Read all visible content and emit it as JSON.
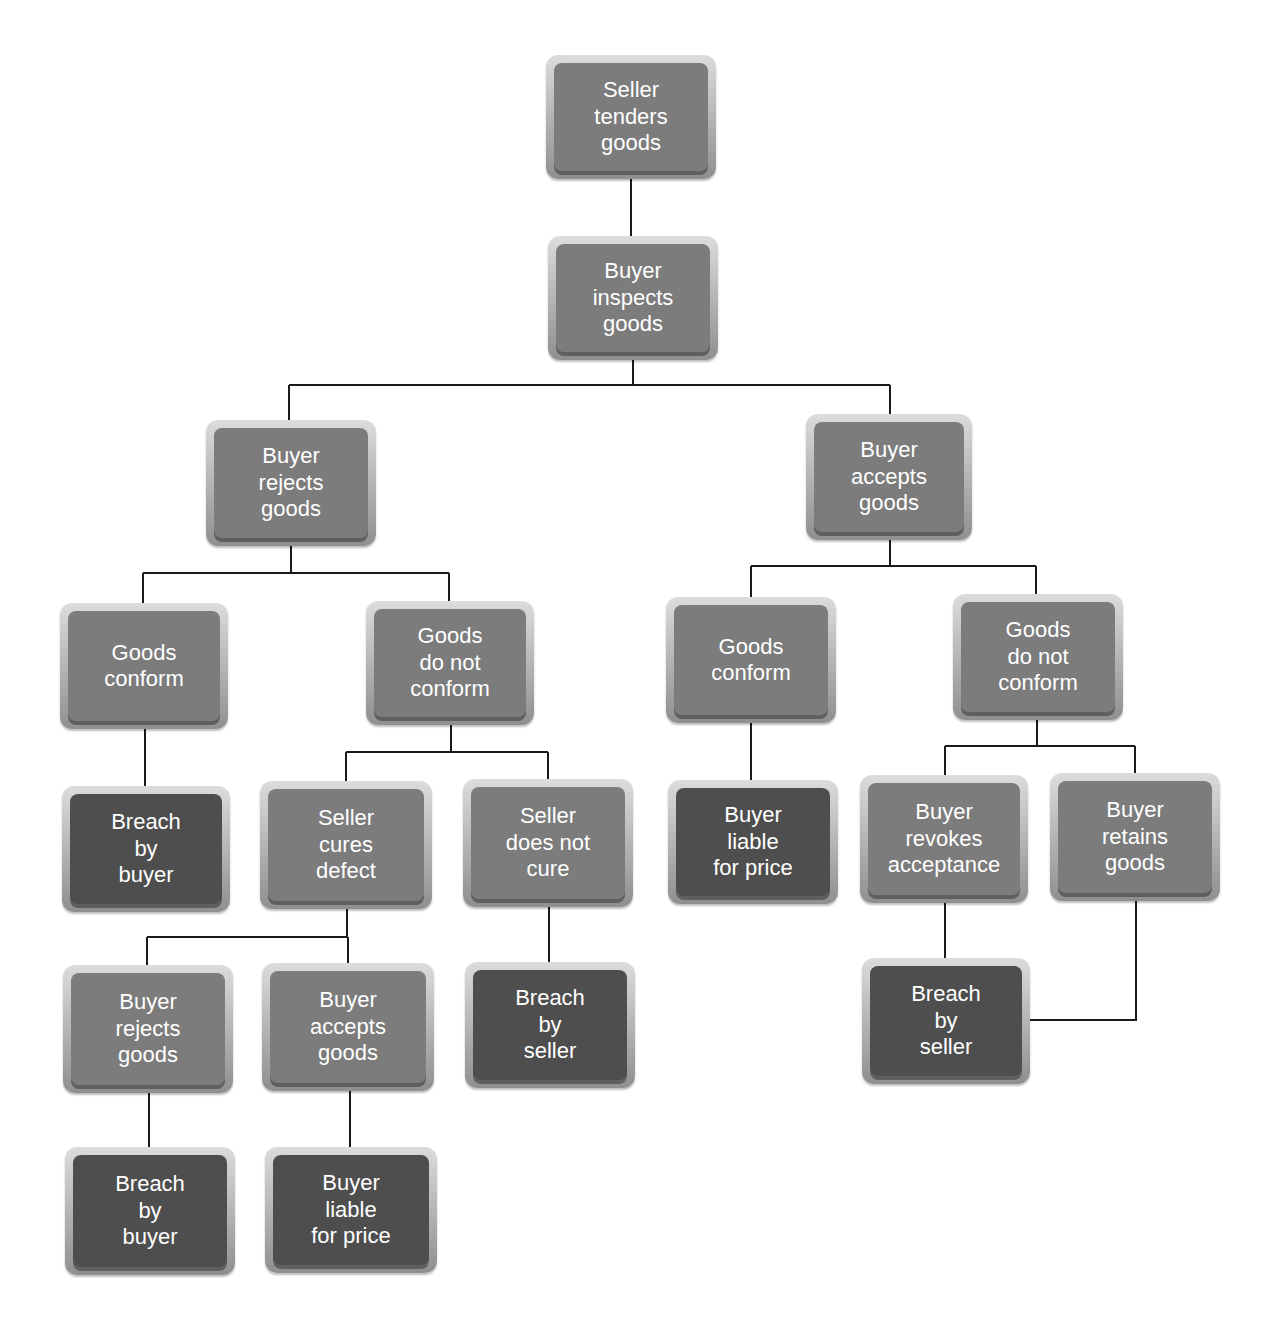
{
  "colors": {
    "line": "#1a1a1a",
    "node_mid": "#7c7c7c",
    "node_dark": "#4e4e4e",
    "text": "#ffffff"
  },
  "nodes": [
    {
      "id": "seller-tenders",
      "tone": "mid",
      "x": 546,
      "y": 55,
      "w": 170,
      "h": 124,
      "lines": [
        "Seller",
        "tenders",
        "goods"
      ]
    },
    {
      "id": "buyer-inspects",
      "tone": "mid",
      "x": 548,
      "y": 236,
      "w": 170,
      "h": 124,
      "lines": [
        "Buyer",
        "inspects",
        "goods"
      ]
    },
    {
      "id": "buyer-rejects",
      "tone": "mid",
      "x": 206,
      "y": 420,
      "w": 170,
      "h": 126,
      "lines": [
        "Buyer",
        "rejects",
        "goods"
      ]
    },
    {
      "id": "buyer-accepts",
      "tone": "mid",
      "x": 806,
      "y": 414,
      "w": 166,
      "h": 126,
      "lines": [
        "Buyer",
        "accepts",
        "goods"
      ]
    },
    {
      "id": "rej-goods-conform",
      "tone": "mid",
      "x": 60,
      "y": 603,
      "w": 168,
      "h": 126,
      "lines": [
        "Goods",
        "conform"
      ]
    },
    {
      "id": "rej-goods-not-conform",
      "tone": "mid",
      "x": 366,
      "y": 601,
      "w": 168,
      "h": 124,
      "lines": [
        "Goods",
        "do not",
        "conform"
      ]
    },
    {
      "id": "acc-goods-conform",
      "tone": "mid",
      "x": 666,
      "y": 597,
      "w": 170,
      "h": 126,
      "lines": [
        "Goods",
        "conform"
      ]
    },
    {
      "id": "acc-goods-not-conform",
      "tone": "mid",
      "x": 953,
      "y": 594,
      "w": 170,
      "h": 126,
      "lines": [
        "Goods",
        "do not",
        "conform"
      ]
    },
    {
      "id": "breach-by-buyer-1",
      "tone": "dark",
      "x": 62,
      "y": 786,
      "w": 168,
      "h": 126,
      "lines": [
        "Breach",
        "by",
        "buyer"
      ]
    },
    {
      "id": "seller-cures",
      "tone": "mid",
      "x": 260,
      "y": 781,
      "w": 172,
      "h": 128,
      "lines": [
        "Seller",
        "cures",
        "defect"
      ]
    },
    {
      "id": "seller-not-cure",
      "tone": "mid",
      "x": 463,
      "y": 779,
      "w": 170,
      "h": 128,
      "lines": [
        "Seller",
        "does not",
        "cure"
      ]
    },
    {
      "id": "buyer-liable-1",
      "tone": "dark",
      "x": 668,
      "y": 780,
      "w": 170,
      "h": 124,
      "lines": [
        "Buyer",
        "liable",
        "for price"
      ]
    },
    {
      "id": "buyer-revokes",
      "tone": "mid",
      "x": 860,
      "y": 775,
      "w": 168,
      "h": 128,
      "lines": [
        "Buyer",
        "revokes",
        "acceptance"
      ]
    },
    {
      "id": "buyer-retains",
      "tone": "mid",
      "x": 1050,
      "y": 773,
      "w": 170,
      "h": 128,
      "lines": [
        "Buyer",
        "retains",
        "goods"
      ]
    },
    {
      "id": "cured-buyer-rejects",
      "tone": "mid",
      "x": 63,
      "y": 965,
      "w": 170,
      "h": 128,
      "lines": [
        "Buyer",
        "rejects",
        "goods"
      ]
    },
    {
      "id": "cured-buyer-accepts",
      "tone": "mid",
      "x": 262,
      "y": 963,
      "w": 172,
      "h": 128,
      "lines": [
        "Buyer",
        "accepts",
        "goods"
      ]
    },
    {
      "id": "breach-by-seller-1",
      "tone": "dark",
      "x": 465,
      "y": 962,
      "w": 170,
      "h": 126,
      "lines": [
        "Breach",
        "by",
        "seller"
      ]
    },
    {
      "id": "breach-by-seller-2",
      "tone": "dark",
      "x": 862,
      "y": 958,
      "w": 168,
      "h": 126,
      "lines": [
        "Breach",
        "by",
        "seller"
      ]
    },
    {
      "id": "breach-by-buyer-2",
      "tone": "dark",
      "x": 65,
      "y": 1147,
      "w": 170,
      "h": 128,
      "lines": [
        "Breach",
        "by",
        "buyer"
      ]
    },
    {
      "id": "buyer-liable-2",
      "tone": "dark",
      "x": 265,
      "y": 1147,
      "w": 172,
      "h": 126,
      "lines": [
        "Buyer",
        "liable",
        "for price"
      ]
    }
  ],
  "connectors": [
    "M631 179 V236",
    "M633 360 V385 M289 385 H890 M289 385 V420 M890 385 V414",
    "M291 546 V573 M143 573 H449 M143 573 V603 M449 573 V601",
    "M890 540 V566 M751 566 H1036 M751 566 V597 M1036 566 V594",
    "M145 729 V786",
    "M451 725 V752 M346 752 H548 M346 752 V781 M548 752 V779",
    "M751 723 V780",
    "M1037 720 V746 M945 746 H1135 M945 746 V775 M1135 746 V773",
    "M347 909 V937 M147 937 H348 M147 937 V965 M348 937 V963",
    "M549 907 V962",
    "M945 903 V958",
    "M1136 901 V1020 H1030",
    "M149 1093 V1147",
    "M350 1091 V1147"
  ]
}
